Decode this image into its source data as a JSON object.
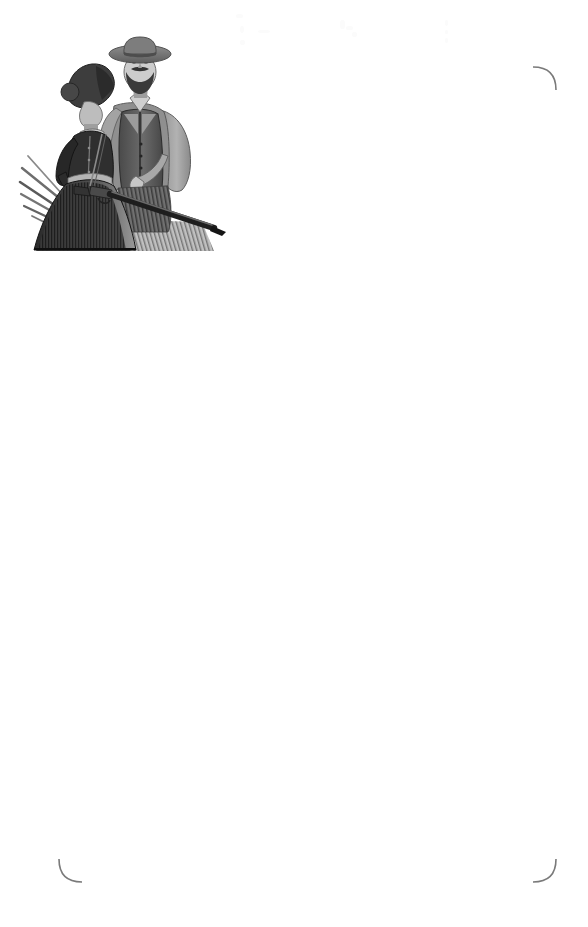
{
  "page": {
    "width": 588,
    "height": 927,
    "background_color": "#ffffff",
    "text_content": ""
  },
  "frame": {
    "name": "rounded-border-frame",
    "left": 58,
    "top": 66,
    "width": 499,
    "height": 817,
    "corner_radius": 24,
    "stroke_color": "#767676",
    "stroke_highlight_color": "#bdbdbd",
    "stroke_width": 1.1,
    "occluded_corner": "top-left"
  },
  "illustration": {
    "name": "frontier-couple-illustration",
    "title": "Frontier couple with rifle",
    "style": "grayscale halftone engraving",
    "left": 18,
    "top": 36,
    "width": 212,
    "height": 219,
    "alt_text": "A bearded man wearing a wide-brimmed cowboy hat, collared shirt and dark vest stands behind a woman in a bonnet and long dark Victorian dress; a rifle is held across them angling down to the right, with grass strokes at the lower left.",
    "subjects": [
      {
        "name": "man",
        "attire": "wide-brimmed hat, collared shirt, dark vest, light sleeves, beard and moustache"
      },
      {
        "name": "woman",
        "attire": "bonnet, high-necked long-sleeved dark dress with full skirt"
      },
      {
        "name": "rifle",
        "detail": "long barrel angled down to the right"
      },
      {
        "name": "grass",
        "detail": "diagonal blade strokes at lower left"
      }
    ],
    "palette": {
      "darkest": "#1c1c1c",
      "dark": "#3a3a3a",
      "mid_dark": "#545454",
      "mid": "#6f6f6f",
      "mid_light": "#8e8e8e",
      "light": "#aeaeae",
      "lightest": "#cfcfcf",
      "highlight": "#e8e8e8"
    }
  },
  "scan_artifacts": {
    "name": "scan-speckle",
    "visible": true,
    "color": "#fbfbfb",
    "marks": [
      {
        "x": 236,
        "y": 14,
        "w": 7,
        "h": 4
      },
      {
        "x": 240,
        "y": 26,
        "w": 4,
        "h": 7
      },
      {
        "x": 258,
        "y": 30,
        "w": 12,
        "h": 3
      },
      {
        "x": 240,
        "y": 40,
        "w": 5,
        "h": 5
      },
      {
        "x": 340,
        "y": 20,
        "w": 5,
        "h": 9
      },
      {
        "x": 346,
        "y": 26,
        "w": 7,
        "h": 4
      },
      {
        "x": 352,
        "y": 32,
        "w": 5,
        "h": 5
      },
      {
        "x": 445,
        "y": 20,
        "w": 3,
        "h": 6
      },
      {
        "x": 445,
        "y": 30,
        "w": 3,
        "h": 4
      },
      {
        "x": 445,
        "y": 38,
        "w": 3,
        "h": 5
      }
    ]
  }
}
